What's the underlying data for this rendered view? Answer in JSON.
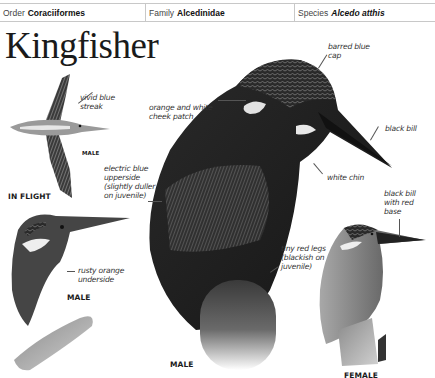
{
  "header": {
    "order_label": "Order",
    "order_value": "Coraciiformes",
    "family_label": "Family",
    "family_value": "Alcedinidae",
    "species_label": "Species",
    "species_value": "Alcedo atthis"
  },
  "title": "Kingfisher",
  "annotations": {
    "vivid_blue_streak": [
      "vivid blue",
      "streak"
    ],
    "cheek_patch": [
      "orange and white",
      "cheek patch"
    ],
    "barred_cap": [
      "barred blue",
      "cap"
    ],
    "black_bill": [
      "black bill"
    ],
    "white_chin": [
      "white chin"
    ],
    "electric_blue": [
      "electric blue",
      "upperside",
      "(slightly duller",
      "on juvenile)"
    ],
    "rusty_orange": [
      "rusty orange",
      "underside"
    ],
    "red_legs": [
      "tiny red legs",
      "(blackish on",
      "juvenile)"
    ],
    "black_bill_red_base": [
      "black bill",
      "with red",
      "base"
    ]
  },
  "captions": {
    "flight_male": "MALE",
    "in_flight": "IN FLIGHT",
    "perched_male": "MALE",
    "main_male": "MALE",
    "female": "FEMALE"
  }
}
